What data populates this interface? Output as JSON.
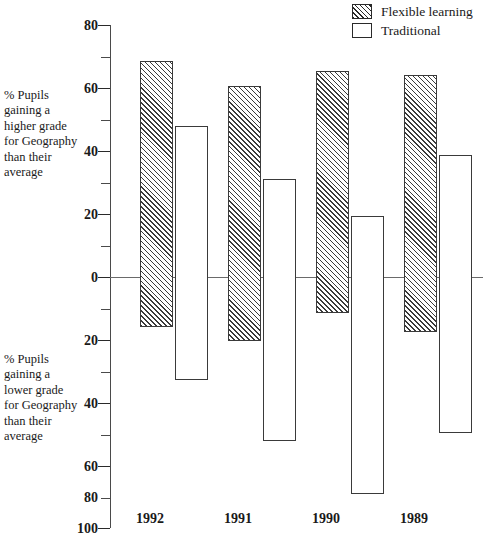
{
  "chart_data": {
    "type": "bar",
    "title": "",
    "subtitle": "",
    "xlabel": "",
    "ylabel": "",
    "categories": [
      "1992",
      "1991",
      "1990",
      "1989"
    ],
    "series": [
      {
        "name": "Flexible learning",
        "swatch": "hatched",
        "positive_values": [
          67,
          58,
          63.5,
          62
        ],
        "negative_values": [
          -28,
          -33,
          -23,
          -30
        ]
      },
      {
        "name": "Traditional",
        "swatch": "white",
        "positive_values": [
          44,
          25,
          11.8,
          33.5
        ],
        "negative_values": [
          -47,
          -69,
          -88,
          -66
        ]
      }
    ],
    "y_upper_axis": {
      "caption": "% Pupils gaining a higher grade for Geography than their average",
      "ticks": [
        0,
        20,
        40,
        60,
        80
      ],
      "minor_ticks": [
        10,
        30,
        50,
        70
      ],
      "max": 80
    },
    "y_lower_axis": {
      "caption": "% Pupils gaining a lower grade for Geography than their average",
      "ticks": [
        0,
        20,
        40,
        60,
        80,
        100
      ],
      "minor_ticks": [
        10,
        30,
        50,
        70,
        90
      ],
      "max": 100
    },
    "ylim": [
      -100,
      80
    ],
    "grid": false,
    "legend_position": "top-right",
    "zero_line": true
  },
  "legend": {
    "items": [
      {
        "label": "Flexible learning",
        "swatch": "hatched"
      },
      {
        "label": "Traditional",
        "swatch": "white"
      }
    ]
  },
  "captions": {
    "upper": "% Pupils gaining a higher grade for Geography than their average",
    "lower": "% Pupils gaining a lower grade for Geography than their average"
  },
  "y_axis_labels": {
    "above": [
      "80",
      "60",
      "40",
      "20",
      "0"
    ],
    "below": [
      "20",
      "40",
      "60",
      "80",
      "100"
    ]
  },
  "x_axis_labels": [
    "1992",
    "1991",
    "1990",
    "1989"
  ],
  "colors": {
    "ink": "#1a1a1a",
    "axis": "#4a4a4a",
    "bar_outline": "#3a3a3a",
    "background": "#ffffff"
  }
}
